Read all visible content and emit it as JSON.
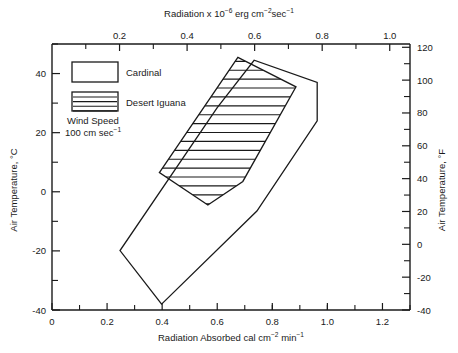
{
  "chart_data": {
    "type": "line",
    "title": "",
    "xlabel": "Radiation Absorbed cal cm⁻² min⁻¹",
    "ylabel": "Air Temperature, °C",
    "top_axis_label": "Radiation x 10⁻⁶ erg cm⁻² sec⁻¹",
    "right_axis_label": "Air Temperature, °F",
    "xlim": [
      0,
      1.3
    ],
    "ylim": [
      -40,
      50
    ],
    "top_xlim": [
      0,
      1.06
    ],
    "right_ylim": [
      -40,
      122
    ],
    "grid": false,
    "legend_position": "upper-left",
    "xticks": [
      "0",
      "0.2",
      "0.4",
      "0.6",
      "0.8",
      "1.0",
      "1.2"
    ],
    "xtick_values": [
      0,
      0.2,
      0.4,
      0.6,
      0.8,
      1.0,
      1.2
    ],
    "xminor_step": 0.1,
    "top_xticks": [
      "0.2",
      "0.4",
      "0.6",
      "0.8",
      "1.0"
    ],
    "top_xtick_values": [
      0.2,
      0.4,
      0.6,
      0.8,
      1.0
    ],
    "top_xminor_step": 0.1,
    "yticks": [
      "40",
      "20",
      "0",
      "-20",
      "-40"
    ],
    "ytick_values": [
      40,
      20,
      0,
      -20,
      -40
    ],
    "yminor_step": 10,
    "right_yticks": [
      "120",
      "100",
      "80",
      "60",
      "40",
      "20",
      "0",
      "-20",
      "-40"
    ],
    "right_ytick_values": [
      120,
      100,
      80,
      60,
      40,
      20,
      0,
      -20,
      -40
    ],
    "right_yminor_step": 10,
    "annotations": [
      {
        "name": "wind-speed",
        "line1": "Wind Speed",
        "line2": "100 cm sec⁻¹"
      }
    ],
    "series": [
      {
        "name": "Cardinal",
        "style": "outline",
        "points_xy": [
          [
            0.398,
            -38.0
          ],
          [
            0.247,
            -19.9
          ],
          [
            0.6,
            28.5
          ],
          [
            0.734,
            44.5
          ],
          [
            0.963,
            37.0
          ],
          [
            0.963,
            24.0
          ],
          [
            0.744,
            -6.5
          ]
        ]
      },
      {
        "name": "Desert Iguana",
        "style": "hatched",
        "points_xy": [
          [
            0.675,
            45.5
          ],
          [
            0.886,
            35.5
          ],
          [
            0.693,
            3.5
          ],
          [
            0.566,
            -4.5
          ],
          [
            0.39,
            6.5
          ]
        ]
      }
    ],
    "legend_entries": [
      {
        "label": "Cardinal",
        "style": "outline"
      },
      {
        "label": "Desert Iguana",
        "style": "hatched"
      }
    ]
  },
  "axes": {
    "top": {
      "title_base": "Radiation x 10",
      "title_exp1": "−6",
      "title_mid": " erg cm",
      "title_exp2": "−2",
      "title_tail": "sec",
      "title_exp3": "−1"
    },
    "bottom": {
      "title_base": "Radiation Absorbed cal cm",
      "title_exp1": "−2",
      "title_mid": " min",
      "title_exp2": "−1"
    },
    "left": {
      "title": "Air Temperature, °C"
    },
    "right": {
      "title": "Air Temperature, °F"
    }
  },
  "legend": {
    "cardinal_label": "Cardinal",
    "iguana_label": "Desert Iguana"
  },
  "annotation": {
    "wind_line1": "Wind Speed",
    "wind_line2_base": "100 cm sec",
    "wind_line2_exp": "−1"
  },
  "colors": {
    "ink": "#1a1a1a",
    "background": "#ffffff"
  }
}
